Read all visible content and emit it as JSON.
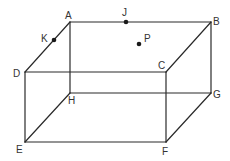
{
  "figure": {
    "type": "rectangular prism (cuboid) with labeled vertices and points",
    "vertices": [
      "A",
      "B",
      "C",
      "D",
      "E",
      "F",
      "G",
      "H"
    ],
    "edges": [
      [
        "A",
        "B"
      ],
      [
        "B",
        "C"
      ],
      [
        "C",
        "D"
      ],
      [
        "D",
        "A"
      ],
      [
        "E",
        "F"
      ],
      [
        "F",
        "G"
      ],
      [
        "G",
        "H"
      ],
      [
        "H",
        "E"
      ],
      [
        "A",
        "H"
      ],
      [
        "B",
        "G"
      ],
      [
        "C",
        "F"
      ],
      [
        "D",
        "E"
      ]
    ],
    "points": [
      {
        "label": "J",
        "on": "edge AB"
      },
      {
        "label": "K",
        "on": "edge AD"
      },
      {
        "label": "P",
        "on": "face ABCD"
      }
    ],
    "labels": {
      "A": "A",
      "B": "B",
      "C": "C",
      "D": "D",
      "E": "E",
      "F": "F",
      "G": "G",
      "H": "H",
      "J": "J",
      "K": "K",
      "P": "P"
    }
  }
}
